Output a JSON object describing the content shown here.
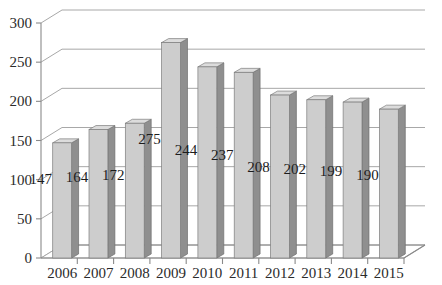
{
  "chart_data": {
    "type": "bar",
    "title": "",
    "subtitle": "",
    "xlabel": "",
    "ylabel": "",
    "categories": [
      "2006",
      "2007",
      "2008",
      "2009",
      "2010",
      "2011",
      "2012",
      "2013",
      "2014",
      "2015"
    ],
    "values": [
      147,
      164,
      172,
      275,
      244,
      237,
      208,
      202,
      199,
      190
    ],
    "series": [
      {
        "name": "",
        "values": [
          147,
          164,
          172,
          275,
          244,
          237,
          208,
          202,
          199,
          190
        ]
      }
    ],
    "data_labels": [
      "147",
      "164",
      "172",
      "275",
      "244",
      "237",
      "208",
      "202",
      "199",
      "190"
    ],
    "ylim": [
      0,
      300
    ],
    "ytick_labels": [
      "0",
      "50",
      "100",
      "150",
      "200",
      "250",
      "300"
    ],
    "ytick_values": [
      0,
      50,
      100,
      150,
      200,
      250,
      300
    ],
    "xtick_labels": [
      "2006",
      "2007",
      "2008",
      "2009",
      "2010",
      "2011",
      "2012",
      "2013",
      "2014",
      "2015"
    ],
    "grid": true,
    "grid_axis": "y",
    "legend": false,
    "legend_position": "none",
    "three_d": true
  },
  "style": {
    "background_color": "#ffffff",
    "bar_front_color": "#cdcdcd",
    "bar_side_color": "#8f8f8f",
    "bar_top_color": "#dcdcdc",
    "grid_color": "#a8a8a8",
    "axis_color": "#8a8a8a",
    "text_color": "#2b2b2b"
  }
}
